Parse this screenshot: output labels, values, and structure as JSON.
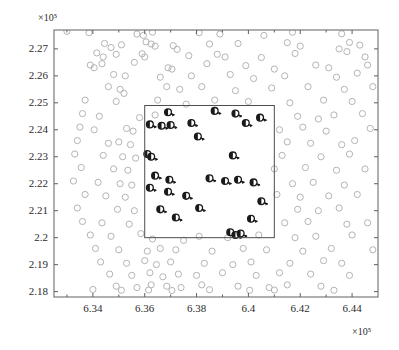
{
  "chart_data": {
    "type": "scatter",
    "title": "",
    "xlabel": "",
    "ylabel": "",
    "x_multiplier": "×10⁵",
    "y_multiplier": "×10⁵",
    "grid": false,
    "legend": "none",
    "xlim": [
      632500,
      645000
    ],
    "ylim": [
      217800,
      227700
    ],
    "xticks": [
      634000,
      636000,
      638000,
      640000,
      642000,
      644000
    ],
    "xticklabels": [
      "6.34",
      "6.36",
      "6.38",
      "6.4",
      "6.42",
      "6.44"
    ],
    "yticks": [
      218000,
      219000,
      220000,
      221000,
      222000,
      223000,
      224000,
      225000,
      226000,
      227000
    ],
    "yticklabels": [
      "2.18",
      "2.19",
      "2.2",
      "2.21",
      "2.22",
      "2.23",
      "2.24",
      "2.25",
      "2.26",
      "2.27"
    ],
    "xminorticks": [
      633000,
      635000,
      637000,
      639000,
      641000,
      643000,
      645000
    ],
    "colors": {
      "background_points": "#b4b4b4",
      "highlight_points": "#1a1a1a",
      "axis": "#606060",
      "inner_box": "#4d4d4d",
      "text": "#2b2b2b"
    },
    "annotations": [
      {
        "type": "rectangle",
        "name": "region-of-interest-box",
        "x0": 636000,
        "y0": 220000,
        "x1": 641000,
        "y1": 224900
      }
    ],
    "series": [
      {
        "name": "background-nodes",
        "marker": "open-circle",
        "color": "#b4b4b4",
        "size": 5,
        "points": [
          [
            633000,
            227650
          ],
          [
            633850,
            227600
          ],
          [
            635700,
            227550
          ],
          [
            635950,
            227500
          ],
          [
            636300,
            227620
          ],
          [
            638100,
            227600
          ],
          [
            638900,
            227550
          ],
          [
            640600,
            227500
          ],
          [
            641700,
            227620
          ],
          [
            643600,
            227560
          ],
          [
            634450,
            227200
          ],
          [
            634700,
            227050
          ],
          [
            635100,
            227150
          ],
          [
            636050,
            227260
          ],
          [
            636250,
            227180
          ],
          [
            636400,
            227100
          ],
          [
            637100,
            227120
          ],
          [
            637250,
            226980
          ],
          [
            638500,
            227180
          ],
          [
            639600,
            227200
          ],
          [
            641500,
            227230
          ],
          [
            642000,
            227100
          ],
          [
            643500,
            227000
          ],
          [
            643900,
            227240
          ],
          [
            644300,
            227140
          ],
          [
            634150,
            226850
          ],
          [
            634400,
            226700
          ],
          [
            634900,
            226800
          ],
          [
            635900,
            226820
          ],
          [
            636000,
            226700
          ],
          [
            637700,
            226750
          ],
          [
            638800,
            226800
          ],
          [
            639100,
            226700
          ],
          [
            640500,
            226680
          ],
          [
            641800,
            226830
          ],
          [
            643800,
            226900
          ],
          [
            644500,
            226700
          ],
          [
            633900,
            226400
          ],
          [
            634050,
            226300
          ],
          [
            634350,
            226450
          ],
          [
            635600,
            226500
          ],
          [
            636900,
            226300
          ],
          [
            637050,
            226250
          ],
          [
            638400,
            226450
          ],
          [
            639900,
            226380
          ],
          [
            641000,
            226250
          ],
          [
            642600,
            226400
          ],
          [
            643100,
            226300
          ],
          [
            644600,
            226400
          ],
          [
            634800,
            226050
          ],
          [
            635250,
            226000
          ],
          [
            636600,
            225950
          ],
          [
            637800,
            226000
          ],
          [
            639300,
            226050
          ],
          [
            640200,
            225900
          ],
          [
            641400,
            226000
          ],
          [
            643400,
            225950
          ],
          [
            644200,
            226100
          ],
          [
            634600,
            225600
          ],
          [
            635050,
            225500
          ],
          [
            635200,
            225350
          ],
          [
            636850,
            225600
          ],
          [
            637350,
            225500
          ],
          [
            638200,
            225600
          ],
          [
            639500,
            225450
          ],
          [
            640900,
            225550
          ],
          [
            642300,
            225600
          ],
          [
            643700,
            225500
          ],
          [
            644800,
            225600
          ],
          [
            633700,
            225100
          ],
          [
            634900,
            225050
          ],
          [
            636500,
            225100
          ],
          [
            637600,
            224950
          ],
          [
            638700,
            225100
          ],
          [
            640000,
            225050
          ],
          [
            641600,
            225000
          ],
          [
            642900,
            225100
          ],
          [
            644000,
            225050
          ],
          [
            633600,
            224600
          ],
          [
            634250,
            224500
          ],
          [
            635800,
            224450
          ],
          [
            636400,
            224550
          ],
          [
            641900,
            224500
          ],
          [
            642700,
            224400
          ],
          [
            643300,
            224550
          ],
          [
            644400,
            224600
          ],
          [
            633500,
            224100
          ],
          [
            634050,
            224000
          ],
          [
            635300,
            224050
          ],
          [
            635550,
            223950
          ],
          [
            641200,
            224000
          ],
          [
            642100,
            224100
          ],
          [
            643000,
            223950
          ],
          [
            644700,
            224050
          ],
          [
            633400,
            223600
          ],
          [
            634600,
            223500
          ],
          [
            635000,
            223550
          ],
          [
            635450,
            223450
          ],
          [
            641500,
            223550
          ],
          [
            642400,
            223500
          ],
          [
            643600,
            223450
          ],
          [
            644100,
            223600
          ],
          [
            633300,
            223100
          ],
          [
            634400,
            223050
          ],
          [
            635150,
            223000
          ],
          [
            635650,
            222950
          ],
          [
            641300,
            223050
          ],
          [
            642800,
            223000
          ],
          [
            643900,
            223100
          ],
          [
            633550,
            222600
          ],
          [
            634800,
            222550
          ],
          [
            635350,
            222500
          ],
          [
            641000,
            222550
          ],
          [
            642200,
            222600
          ],
          [
            643400,
            222500
          ],
          [
            644500,
            222550
          ],
          [
            633250,
            222100
          ],
          [
            634200,
            222050
          ],
          [
            635050,
            222000
          ],
          [
            635500,
            221950
          ],
          [
            641700,
            222000
          ],
          [
            642500,
            222050
          ],
          [
            643700,
            221950
          ],
          [
            633700,
            221600
          ],
          [
            634500,
            221550
          ],
          [
            635250,
            221500
          ],
          [
            641100,
            221600
          ],
          [
            642000,
            221500
          ],
          [
            643100,
            221550
          ],
          [
            644200,
            221600
          ],
          [
            633400,
            221100
          ],
          [
            634950,
            221050
          ],
          [
            635600,
            221000
          ],
          [
            641900,
            221050
          ],
          [
            642700,
            221000
          ],
          [
            643500,
            221100
          ],
          [
            633600,
            220600
          ],
          [
            634350,
            220550
          ],
          [
            635400,
            220500
          ],
          [
            641400,
            220550
          ],
          [
            642300,
            220600
          ],
          [
            643800,
            220500
          ],
          [
            644600,
            220550
          ],
          [
            633900,
            220100
          ],
          [
            634700,
            220050
          ],
          [
            635850,
            220150
          ],
          [
            636300,
            219950
          ],
          [
            637500,
            219900
          ],
          [
            638100,
            220050
          ],
          [
            639200,
            220000
          ],
          [
            640400,
            220100
          ],
          [
            641800,
            220000
          ],
          [
            642600,
            220050
          ],
          [
            644000,
            220100
          ],
          [
            634100,
            219600
          ],
          [
            635000,
            219550
          ],
          [
            636100,
            219500
          ],
          [
            636600,
            219600
          ],
          [
            637200,
            219550
          ],
          [
            638600,
            219500
          ],
          [
            639800,
            219600
          ],
          [
            640700,
            219550
          ],
          [
            642100,
            219500
          ],
          [
            643200,
            219600
          ],
          [
            644800,
            219550
          ],
          [
            634300,
            219100
          ],
          [
            635300,
            219050
          ],
          [
            636000,
            219150
          ],
          [
            636450,
            219000
          ],
          [
            637000,
            219100
          ],
          [
            638300,
            219050
          ],
          [
            639400,
            219000
          ],
          [
            640100,
            219100
          ],
          [
            641600,
            219050
          ],
          [
            642900,
            219150
          ],
          [
            643600,
            219050
          ],
          [
            634650,
            218650
          ],
          [
            635500,
            218600
          ],
          [
            636200,
            218700
          ],
          [
            636700,
            218550
          ],
          [
            637300,
            218650
          ],
          [
            638000,
            218600
          ],
          [
            639000,
            218700
          ],
          [
            640300,
            218600
          ],
          [
            641200,
            218700
          ],
          [
            642400,
            218650
          ],
          [
            643900,
            218600
          ],
          [
            634900,
            218200
          ],
          [
            635700,
            218150
          ],
          [
            636250,
            218250
          ],
          [
            636850,
            218200
          ],
          [
            637400,
            218150
          ],
          [
            638200,
            218250
          ],
          [
            639600,
            218200
          ],
          [
            640800,
            218150
          ],
          [
            641500,
            218250
          ],
          [
            642800,
            218200
          ],
          [
            634000,
            218080
          ],
          [
            635100,
            218050
          ],
          [
            636150,
            218060
          ],
          [
            637050,
            218040
          ],
          [
            638500,
            218070
          ],
          [
            640050,
            218050
          ],
          [
            641000,
            218060
          ],
          [
            643300,
            218050
          ]
        ]
      },
      {
        "name": "highlighted-nodes-with-direction",
        "marker": "filled-circle-with-arrow",
        "color": "#1a1a1a",
        "size": 6,
        "points": [
          [
            636900,
            224650
          ],
          [
            638700,
            224700
          ],
          [
            639500,
            224600
          ],
          [
            636200,
            224200
          ],
          [
            636650,
            224150
          ],
          [
            637000,
            224180
          ],
          [
            637800,
            224250
          ],
          [
            639900,
            224250
          ],
          [
            640450,
            224450
          ],
          [
            638050,
            223750
          ],
          [
            636100,
            223100
          ],
          [
            636250,
            223000
          ],
          [
            639400,
            223050
          ],
          [
            636400,
            222300
          ],
          [
            636950,
            222150
          ],
          [
            638500,
            222200
          ],
          [
            639100,
            222100
          ],
          [
            639600,
            222150
          ],
          [
            640200,
            222050
          ],
          [
            636200,
            221850
          ],
          [
            636900,
            221700
          ],
          [
            637600,
            221550
          ],
          [
            640500,
            221350
          ],
          [
            636600,
            221050
          ],
          [
            638100,
            221100
          ],
          [
            637200,
            220750
          ],
          [
            640100,
            220700
          ],
          [
            639300,
            220200
          ],
          [
            639500,
            220100
          ],
          [
            639700,
            220150
          ]
        ]
      }
    ]
  },
  "axes": {
    "name": "scatter-plot-axes",
    "x_multiplier_label": "×10⁵",
    "y_multiplier_label": "×10⁵"
  }
}
